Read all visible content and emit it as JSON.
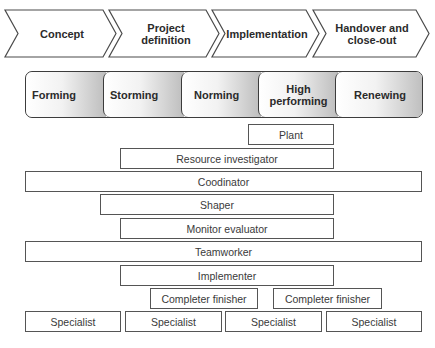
{
  "project_phases": [
    {
      "label": "Concept"
    },
    {
      "label": "Project\ndefinition"
    },
    {
      "label": "Implementation"
    },
    {
      "label": "Handover and\nclose-out"
    }
  ],
  "team_stages": [
    {
      "label": "Forming"
    },
    {
      "label": "Storming"
    },
    {
      "label": "Norming"
    },
    {
      "label": "High\nperforming"
    },
    {
      "label": "Renewing"
    }
  ],
  "belbin_roles": {
    "plant": "Plant",
    "resource_investigator": "Resource investigator",
    "coordinator": "Coodinator",
    "shaper": "Shaper",
    "monitor_evaluator": "Monitor evaluator",
    "teamworker": "Teamworker",
    "implementer": "Implementer",
    "completer_finisher_1": "Completer finisher",
    "completer_finisher_2": "Completer finisher",
    "specialist_1": "Specialist",
    "specialist_2": "Specialist",
    "specialist_3": "Specialist",
    "specialist_4": "Specialist"
  },
  "colors": {
    "outline": "#3c3c3c",
    "stage_gradient_light": "#ffffff",
    "stage_gradient_dark": "#bdbdbd",
    "text": "#2b2b2b"
  }
}
